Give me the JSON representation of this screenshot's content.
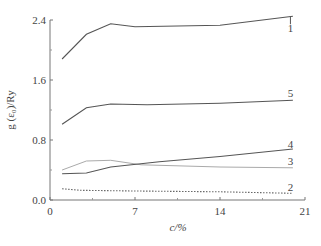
{
  "chart_data": {
    "type": "line",
    "title": "",
    "xlabel": "c/%",
    "ylabel": "g (ε₀)/Ry",
    "xlim": [
      0,
      21
    ],
    "ylim": [
      0.0,
      2.4
    ],
    "x_ticks": [
      0,
      7,
      14,
      21
    ],
    "x_tick_labels": [
      "0",
      "7",
      "14",
      "21"
    ],
    "x_minor_ticks": [
      3.5,
      10.5,
      17.5
    ],
    "y_ticks": [
      0.0,
      0.8,
      1.6,
      2.4
    ],
    "y_tick_labels": [
      "0.0",
      "0.8",
      "1.6",
      "2.4"
    ],
    "y_minor_ticks": [
      0.4,
      1.2,
      2.0
    ],
    "grid": false,
    "legend": "inline curve labels at right end",
    "series": [
      {
        "name": "1",
        "style": "solid",
        "color": "#555555",
        "x": [
          1,
          3,
          5,
          7,
          14,
          20
        ],
        "values": [
          1.88,
          2.21,
          2.35,
          2.31,
          2.33,
          2.45
        ]
      },
      {
        "name": "2",
        "style": "dotted",
        "color": "#666666",
        "x": [
          1,
          2.5,
          7,
          14,
          20
        ],
        "values": [
          0.15,
          0.13,
          0.12,
          0.11,
          0.09
        ]
      },
      {
        "name": "3",
        "style": "solid-light",
        "color": "#aaaaaa",
        "x": [
          1,
          3,
          5,
          7.5,
          14,
          20
        ],
        "values": [
          0.4,
          0.52,
          0.53,
          0.47,
          0.44,
          0.43
        ]
      },
      {
        "name": "4",
        "style": "solid",
        "color": "#555555",
        "x": [
          1,
          3,
          5,
          9,
          14,
          20
        ],
        "values": [
          0.35,
          0.36,
          0.44,
          0.51,
          0.58,
          0.68
        ]
      },
      {
        "name": "5",
        "style": "solid",
        "color": "#555555",
        "x": [
          1,
          3,
          5,
          8,
          14,
          20
        ],
        "values": [
          1.01,
          1.23,
          1.28,
          1.27,
          1.29,
          1.33
        ]
      }
    ],
    "curve_labels": [
      {
        "text": "1",
        "x": 19.8,
        "y": 2.3
      },
      {
        "text": "5",
        "x": 19.8,
        "y": 1.43
      },
      {
        "text": "4",
        "x": 19.8,
        "y": 0.75
      },
      {
        "text": "3",
        "x": 19.8,
        "y": 0.52
      },
      {
        "text": "2",
        "x": 19.8,
        "y": 0.18
      }
    ]
  }
}
